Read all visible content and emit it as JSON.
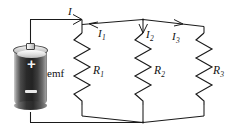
{
  "figure": {
    "type": "circuit-diagram",
    "background_color": "#ffffff",
    "line_color": "#1a1a1a"
  },
  "source": {
    "name": "emf-battery",
    "label": "emf",
    "positive_terminal_symbol": "+",
    "negative_terminal_symbol": "−",
    "body_color_dark": "#232323",
    "body_color_light": "#cfcfcf",
    "cap_color": "#d2d2d2"
  },
  "currents": [
    {
      "id": "I",
      "symbol": "I",
      "subscript": "",
      "direction": "right",
      "description": "total current from battery"
    },
    {
      "id": "I1",
      "symbol": "I",
      "subscript": "1",
      "direction": "left",
      "description": "branch current through R1"
    },
    {
      "id": "I2",
      "symbol": "I",
      "subscript": "2",
      "direction": "down",
      "description": "branch current through R2"
    },
    {
      "id": "I3",
      "symbol": "I",
      "subscript": "3",
      "direction": "right",
      "description": "branch current through R3"
    }
  ],
  "resistors": [
    {
      "id": "R1",
      "symbol": "R",
      "subscript": "1",
      "label": "R₁"
    },
    {
      "id": "R2",
      "symbol": "R",
      "subscript": "2",
      "label": "R₂"
    },
    {
      "id": "R3",
      "symbol": "R",
      "subscript": "3",
      "label": "R₃"
    }
  ]
}
